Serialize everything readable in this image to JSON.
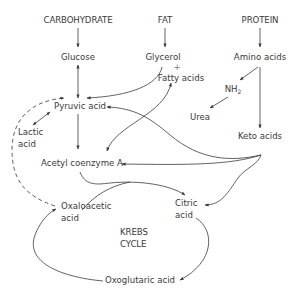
{
  "diagram": {
    "type": "metabolic pathway",
    "sources": {
      "carbohydrate": "CARBOHYDRATE",
      "fat": "FAT",
      "protein": "PROTEIN"
    },
    "nodes": {
      "glucose": "Glucose",
      "glycerol": "Glycerol",
      "plus": "+",
      "fatty_acids": "Fatty acids",
      "amino_acids": "Amino acids",
      "nh2_base": "NH",
      "nh2_sub": "2",
      "urea": "Urea",
      "pyruvic_acid": "Pyruvic acid",
      "lactic_acid_1": "Lactic",
      "lactic_acid_2": "acid",
      "keto_acids": "Keto acids",
      "acetyl_coa": "Acetyl coenzyme A",
      "oxaloacetic_1": "Oxaloacetic",
      "oxaloacetic_2": "acid",
      "citric_1": "Citric",
      "citric_2": "acid",
      "krebs_1": "KREBS",
      "krebs_2": "CYCLE",
      "oxoglutaric": "Oxoglutaric acid"
    },
    "edges": [
      {
        "from": "CARBOHYDRATE",
        "to": "Glucose"
      },
      {
        "from": "FAT",
        "to": "Glycerol + Fatty acids"
      },
      {
        "from": "PROTEIN",
        "to": "Amino acids"
      },
      {
        "from": "Glucose",
        "to": "Pyruvic acid",
        "bidirectional": true
      },
      {
        "from": "Glycerol",
        "to": "Pyruvic acid"
      },
      {
        "from": "Amino acids",
        "to": "NH2"
      },
      {
        "from": "NH2",
        "to": "Urea"
      },
      {
        "from": "Amino acids",
        "to": "Keto acids"
      },
      {
        "from": "Pyruvic acid",
        "to": "Lactic acid",
        "bidirectional": true
      },
      {
        "from": "Pyruvic acid",
        "to": "Acetyl coenzyme A"
      },
      {
        "from": "Fatty acids",
        "to": "Acetyl coenzyme A",
        "bidirectional": true
      },
      {
        "from": "Keto acids",
        "to": "Pyruvic acid"
      },
      {
        "from": "Keto acids",
        "to": "Acetyl coenzyme A"
      },
      {
        "from": "Keto acids",
        "to": "Citric acid"
      },
      {
        "from": "Acetyl coenzyme A",
        "to": "Citric acid"
      },
      {
        "from": "Oxaloacetic acid",
        "to": "Citric acid"
      },
      {
        "from": "Citric acid",
        "to": "Oxoglutaric acid"
      },
      {
        "from": "Oxoglutaric acid",
        "to": "Oxaloacetic acid"
      },
      {
        "from": "Oxaloacetic acid",
        "to": "Pyruvic acid",
        "style": "dashed"
      }
    ],
    "colors": {
      "text": "#3a3a3a",
      "line": "#3a3a3a",
      "background": "#ffffff"
    }
  }
}
